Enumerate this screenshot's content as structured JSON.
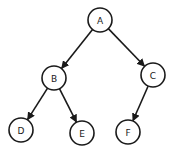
{
  "diagram": {
    "type": "binary-tree",
    "colors": {
      "stroke": "#1a1a1a",
      "fill": "#ffffff",
      "background": "#ffffff"
    },
    "nodes": [
      {
        "id": "A",
        "label": "A",
        "x": 100,
        "y": 20
      },
      {
        "id": "B",
        "label": "B",
        "x": 54,
        "y": 78
      },
      {
        "id": "C",
        "label": "C",
        "x": 153,
        "y": 75
      },
      {
        "id": "D",
        "label": "D",
        "x": 21,
        "y": 130
      },
      {
        "id": "E",
        "label": "E",
        "x": 82,
        "y": 133
      },
      {
        "id": "F",
        "label": "F",
        "x": 128,
        "y": 132
      }
    ],
    "edges": [
      {
        "from": "A",
        "to": "B"
      },
      {
        "from": "A",
        "to": "C"
      },
      {
        "from": "B",
        "to": "D"
      },
      {
        "from": "B",
        "to": "E"
      },
      {
        "from": "C",
        "to": "F"
      }
    ]
  }
}
